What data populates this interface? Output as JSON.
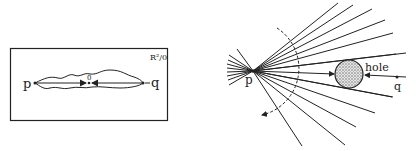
{
  "left_panel": {
    "space_label": "R²/0",
    "origin_label": "0",
    "point_p_label": "p",
    "point_q_label": "q"
  },
  "right_panel": {
    "hole_label": "hole",
    "point_p_label": "p",
    "point_q_label": "q"
  },
  "colors": {
    "ink": "#222222",
    "hole_fill": "#bdbdbd",
    "background": "#ffffff"
  }
}
